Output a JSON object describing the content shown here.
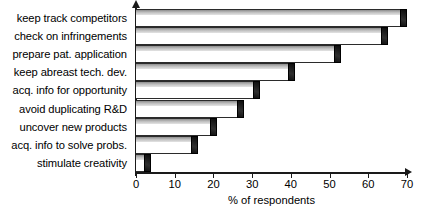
{
  "chart_data": {
    "type": "bar",
    "orientation": "horizontal",
    "title": "",
    "xlabel": "% of respondents",
    "ylabel": "",
    "xlim": [
      0,
      70
    ],
    "xticks": [
      0,
      10,
      20,
      30,
      40,
      50,
      60,
      70
    ],
    "grid": false,
    "legend": null,
    "categories": [
      "keep track competitors",
      "check on infringements",
      "prepare pat. application",
      "keep abreast tech. dev.",
      "acq. info for opportunity",
      "avoid duplicating R&D",
      "uncover new products",
      "acq. info to solve probs.",
      "stimulate creativity"
    ],
    "values": [
      70,
      65,
      53,
      41,
      32,
      28,
      21,
      16,
      4
    ],
    "bar_style": {
      "face_color": "#ffffff",
      "top_face_color": "#b0b0b0",
      "edge_color": "#2b2b2b",
      "cap_color": "#141414"
    }
  }
}
